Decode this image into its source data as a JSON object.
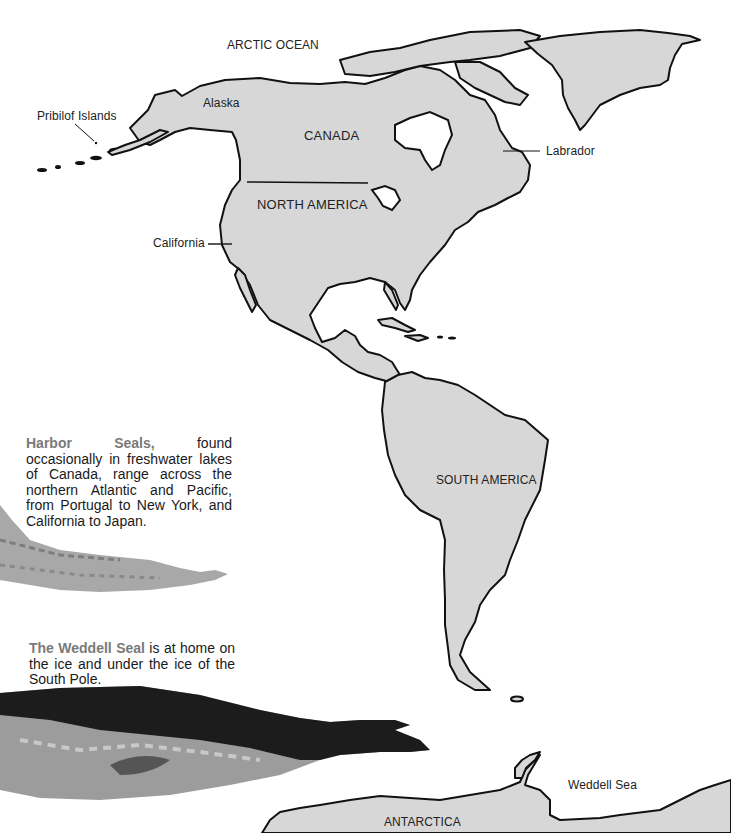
{
  "map": {
    "labels": {
      "arctic_ocean": "ARCTIC OCEAN",
      "alaska": "Alaska",
      "pribilof_islands": "Pribilof Islands",
      "canada": "CANADA",
      "labrador": "Labrador",
      "north_america": "NORTH AMERICA",
      "california": "California",
      "south_america": "SOUTH AMERICA",
      "weddell_sea": "Weddell Sea",
      "antarctica": "ANTARCTICA"
    },
    "colors": {
      "land": "#d7d7d7",
      "outline": "#111111",
      "ocean": "#ffffff",
      "highlight_text": "#7a7a7a"
    }
  },
  "captions": {
    "harbor_seal": {
      "highlight": "Harbor Seals,",
      "text": " found occasionally in freshwater lakes of Canada, range across the northern Atlantic and Pacific, from Portugal to New York, and California to Japan."
    },
    "weddell_seal": {
      "highlight": "The Weddell Seal",
      "text": " is at home on the ice and under the ice of the South Pole."
    }
  },
  "illustrations": {
    "harbor_seal": "harbor-seal-illustration",
    "weddell_seal": "weddell-seal-illustration"
  }
}
